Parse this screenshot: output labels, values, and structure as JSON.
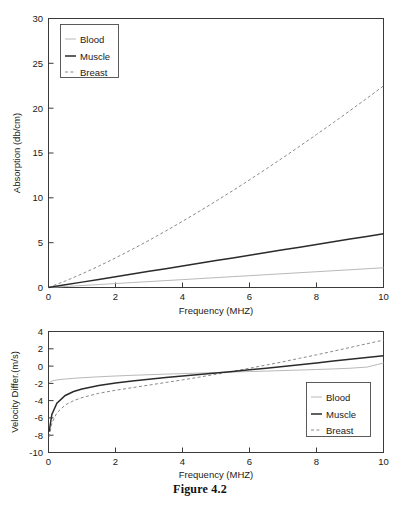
{
  "figure": {
    "caption": "Figure 4.2"
  },
  "legend": {
    "entries": [
      {
        "label": "Blood",
        "style": "thin-solid",
        "color": "#b9b9b9"
      },
      {
        "label": "Muscle",
        "style": "thick-solid",
        "color": "#2b2b2b"
      },
      {
        "label": "Breast",
        "style": "dashed",
        "color": "#8a8a8a"
      }
    ]
  },
  "chart_data": [
    {
      "type": "line",
      "name": "absorption-vs-frequency",
      "title": "",
      "xlabel": "Frequency (MHZ)",
      "ylabel": "Absorption (db/cm)",
      "xlim": [
        0,
        10
      ],
      "ylim": [
        0,
        30
      ],
      "xticks": [
        0,
        2,
        4,
        6,
        8,
        10
      ],
      "yticks": [
        0,
        5,
        10,
        15,
        20,
        25,
        30
      ],
      "grid": false,
      "legend_position": "upper-left",
      "x": [
        0,
        0.5,
        1,
        1.5,
        2,
        2.5,
        3,
        3.5,
        4,
        4.5,
        5,
        5.5,
        6,
        6.5,
        7,
        7.5,
        8,
        8.5,
        9,
        9.5,
        10
      ],
      "series": [
        {
          "name": "Blood",
          "values": [
            0,
            0.11,
            0.22,
            0.33,
            0.44,
            0.55,
            0.66,
            0.77,
            0.88,
            0.99,
            1.1,
            1.21,
            1.32,
            1.43,
            1.54,
            1.65,
            1.76,
            1.87,
            1.98,
            2.09,
            2.2
          ]
        },
        {
          "name": "Muscle",
          "values": [
            0,
            0.3,
            0.6,
            0.9,
            1.2,
            1.5,
            1.8,
            2.1,
            2.4,
            2.7,
            3.0,
            3.3,
            3.6,
            3.9,
            4.2,
            4.5,
            4.8,
            5.1,
            5.4,
            5.7,
            6.0
          ]
        },
        {
          "name": "Breast",
          "values": [
            0,
            0.72,
            1.52,
            2.38,
            3.3,
            4.26,
            5.26,
            6.3,
            7.38,
            8.49,
            9.63,
            10.8,
            12.0,
            13.23,
            14.48,
            15.76,
            17.06,
            18.38,
            19.72,
            21.09,
            22.48
          ]
        }
      ]
    },
    {
      "type": "line",
      "name": "velocity-difference-vs-frequency",
      "title": "",
      "xlabel": "Frequency (MHZ)",
      "ylabel": "Velocity Differ.(m/s)",
      "xlim": [
        0,
        10
      ],
      "ylim": [
        -10,
        4
      ],
      "xticks": [
        0,
        2,
        4,
        6,
        8,
        10
      ],
      "yticks": [
        -10,
        -8,
        -6,
        -4,
        -2,
        0,
        2,
        4
      ],
      "grid": false,
      "legend_position": "lower-right",
      "x": [
        0.02,
        0.1,
        0.25,
        0.5,
        0.75,
        1,
        1.5,
        2,
        2.5,
        3,
        3.5,
        4,
        4.5,
        5,
        5.5,
        6,
        6.5,
        7,
        7.5,
        8,
        8.5,
        9,
        9.5,
        10
      ],
      "series": [
        {
          "name": "Blood",
          "values": [
            -1.95,
            -1.72,
            -1.6,
            -1.5,
            -1.42,
            -1.35,
            -1.24,
            -1.15,
            -1.07,
            -1.0,
            -0.93,
            -0.87,
            -0.81,
            -0.75,
            -0.69,
            -0.63,
            -0.58,
            -0.52,
            -0.46,
            -0.4,
            -0.33,
            -0.25,
            -0.12,
            0.35
          ]
        },
        {
          "name": "Muscle",
          "values": [
            -7.6,
            -5.6,
            -4.3,
            -3.4,
            -2.95,
            -2.65,
            -2.25,
            -1.95,
            -1.72,
            -1.52,
            -1.33,
            -1.15,
            -0.98,
            -0.8,
            -0.62,
            -0.43,
            -0.25,
            -0.05,
            0.15,
            0.36,
            0.58,
            0.78,
            0.98,
            1.2
          ]
        },
        {
          "name": "Breast",
          "values": [
            -8.2,
            -6.6,
            -5.4,
            -4.5,
            -4.0,
            -3.65,
            -3.15,
            -2.8,
            -2.5,
            -2.2,
            -1.9,
            -1.6,
            -1.28,
            -0.95,
            -0.6,
            -0.25,
            0.12,
            0.5,
            0.9,
            1.3,
            1.72,
            2.15,
            2.58,
            3.0
          ]
        }
      ]
    }
  ]
}
